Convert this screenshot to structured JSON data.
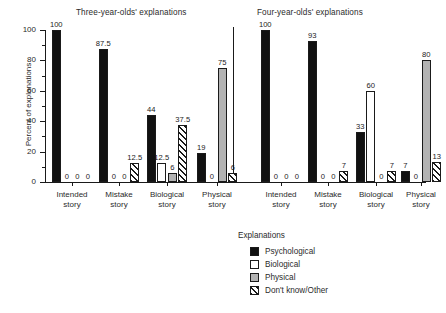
{
  "chart_data": {
    "type": "bar",
    "title": "",
    "panels": [
      {
        "id": "three-year-olds",
        "title": "Three-year-olds' explanations"
      },
      {
        "id": "four-year-olds",
        "title": "Four-year-olds' explanations"
      }
    ],
    "categories": [
      "Intended story",
      "Mistake story",
      "Biological story",
      "Physical story",
      "Intended story",
      "Mistake story",
      "Biological story",
      "Physical story"
    ],
    "category_lines": [
      [
        "Intended",
        "story"
      ],
      [
        "Mistake",
        "story"
      ],
      [
        "Biological",
        "story"
      ],
      [
        "Physical",
        "story"
      ],
      [
        "Intended",
        "story"
      ],
      [
        "Mistake",
        "story"
      ],
      [
        "Biological",
        "story"
      ],
      [
        "Physical",
        "story"
      ]
    ],
    "series": [
      {
        "name": "Psychological",
        "key": "psych",
        "color": "#111111",
        "values": [
          100,
          87.5,
          44,
          19,
          100,
          93,
          33,
          7
        ]
      },
      {
        "name": "Biological",
        "key": "bio",
        "color": "#ffffff",
        "values": [
          0,
          0,
          12.5,
          0,
          0,
          0,
          60,
          0
        ]
      },
      {
        "name": "Physical",
        "key": "phys",
        "color": "#b3b3b3",
        "values": [
          0,
          0,
          6,
          75,
          0,
          0,
          0,
          80
        ]
      },
      {
        "name": "Don't know/Other",
        "key": "dk",
        "color": "hatched",
        "values": [
          0,
          12.5,
          37.5,
          6,
          0,
          7,
          7,
          13
        ]
      }
    ],
    "value_labels": [
      [
        "100",
        "0",
        "0",
        "0"
      ],
      [
        "87.5",
        "0",
        "0",
        "12.5"
      ],
      [
        "44",
        "12.5",
        "6",
        "37.5"
      ],
      [
        "19",
        "0",
        "75",
        "6"
      ],
      [
        "100",
        "0",
        "0",
        "0"
      ],
      [
        "93",
        "0",
        "0",
        "7"
      ],
      [
        "33",
        "60",
        "0",
        "7"
      ],
      [
        "7",
        "0",
        "80",
        "13"
      ]
    ],
    "xlabel": "",
    "ylabel": "Percent of explanations",
    "ylim": [
      0,
      100
    ],
    "yticks": [
      0,
      20,
      40,
      60,
      80,
      100
    ],
    "ytick_labels": [
      "0",
      "20",
      "40",
      "60",
      "80",
      "100"
    ],
    "yminor_ticks": [
      10,
      30,
      50,
      70,
      90
    ],
    "grid": false,
    "legend_position": "bottom-right"
  },
  "legend": {
    "title": "Explanations",
    "items": [
      {
        "label": "Psychological"
      },
      {
        "label": "Biological"
      },
      {
        "label": "Physical"
      },
      {
        "label": "Don't know/Other"
      }
    ]
  }
}
